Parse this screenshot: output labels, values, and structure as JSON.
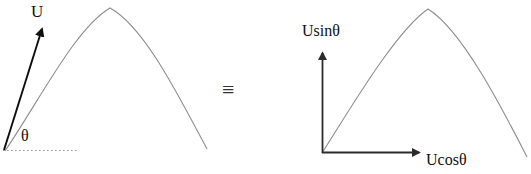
{
  "figure": {
    "title_text": "",
    "background_color": "#ffffff",
    "width": 531,
    "height": 174
  },
  "left_panel": {
    "name": "projectile-with-resultant-velocity",
    "velocity_vector": {
      "label": "U",
      "semantic": "initial-velocity-vector",
      "color": "#0d0d0d",
      "tail": [
        4,
        150
      ],
      "tip": [
        42,
        28
      ]
    },
    "angle": {
      "label": "θ",
      "semantic": "launch-angle",
      "color": "#111111"
    },
    "ground_line": {
      "semantic": "horizontal-reference-dotted-line",
      "style": "dotted",
      "color": "#9a9a9a",
      "from": [
        3,
        150
      ],
      "to": [
        78,
        150
      ]
    },
    "trajectory": {
      "semantic": "parabolic-trajectory",
      "color": "#8d8d8d",
      "start": [
        5,
        151
      ],
      "apex": [
        110,
        8
      ],
      "end": [
        207,
        149
      ]
    }
  },
  "equivalence": {
    "symbol": "≡",
    "semantic": "equivalence-sign",
    "color": "#333333"
  },
  "right_panel": {
    "name": "projectile-with-velocity-components",
    "vertical_axis": {
      "label": "Usinθ",
      "semantic": "vertical-velocity-component-axis",
      "color": "#2b2b2b",
      "origin": [
        322,
        153
      ],
      "tip": [
        322,
        52
      ]
    },
    "horizontal_axis": {
      "label": "Ucosθ",
      "semantic": "horizontal-velocity-component-axis",
      "color": "#2b2b2b",
      "origin": [
        322,
        153
      ],
      "tip": [
        420,
        153
      ]
    },
    "trajectory": {
      "semantic": "parabolic-trajectory",
      "color": "#8d8d8d",
      "start": [
        322,
        153
      ],
      "apex": [
        428,
        9
      ],
      "end": [
        527,
        157
      ]
    }
  },
  "colors": {
    "ink_dark": "#0d0d0d",
    "ink_axis": "#2b2b2b",
    "curve_gray": "#8d8d8d",
    "dotted_gray": "#9a9a9a",
    "background": "#ffffff"
  }
}
